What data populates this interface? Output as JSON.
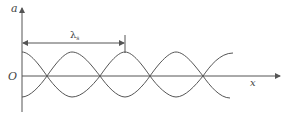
{
  "diagram": {
    "title": "",
    "type": "standing-wave envelope",
    "axes": {
      "y_label": "a",
      "x_label": "x",
      "origin_label": "O"
    },
    "dimension": {
      "symbol": "λ",
      "subscript": "s",
      "description": "one wavelength measured from the y-axis to the next peak"
    },
    "curves": [
      {
        "name": "upper-envelope",
        "phase": "cos"
      },
      {
        "name": "lower-envelope",
        "phase": "-cos"
      }
    ],
    "colors": {
      "stroke": "#555555",
      "text": "#444444",
      "background": "#ffffff"
    }
  }
}
